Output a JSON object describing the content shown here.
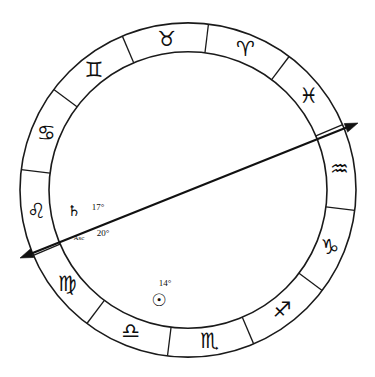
{
  "chart": {
    "type": "zodiac-wheel",
    "background_color": "#ffffff",
    "line_color": "#1a1a1a",
    "geometry": {
      "center_x": 188,
      "center_y": 190,
      "outer_radius": 168,
      "inner_radius": 139,
      "glyph_radius": 153,
      "sector_count": 12,
      "sector_span_degrees": 30,
      "aries_start_angle": -83
    },
    "signs": [
      {
        "name": "Aries",
        "glyph": "♈",
        "index": 0,
        "angle": -68,
        "glyph_size": 22
      },
      {
        "name": "Taurus",
        "glyph": "♉",
        "index": 1,
        "angle": -98,
        "glyph_size": 22
      },
      {
        "name": "Gemini",
        "glyph": "♊",
        "index": 2,
        "angle": -128,
        "glyph_size": 22
      },
      {
        "name": "Cancer",
        "glyph": "♋",
        "index": 3,
        "angle": -158,
        "glyph_size": 22
      },
      {
        "name": "Leo",
        "glyph": "♌",
        "index": 4,
        "angle": -188,
        "glyph_size": 22
      },
      {
        "name": "Virgo",
        "glyph": "♍",
        "index": 5,
        "angle": -218,
        "glyph_size": 21
      },
      {
        "name": "Libra",
        "glyph": "♎",
        "index": 6,
        "angle": -248,
        "glyph_size": 22
      },
      {
        "name": "Scorpio",
        "glyph": "♏",
        "index": 7,
        "angle": -278,
        "glyph_size": 21
      },
      {
        "name": "Sagittarius",
        "glyph": "♐",
        "index": 8,
        "angle": -308,
        "glyph_size": 19
      },
      {
        "name": "Capricorn",
        "glyph": "♑",
        "index": 9,
        "angle": -338,
        "glyph_size": 22
      },
      {
        "name": "Aquarius",
        "glyph": "♒",
        "index": 10,
        "angle": -368,
        "glyph_size": 21
      },
      {
        "name": "Pisces",
        "glyph": "♓",
        "index": 11,
        "angle": -398,
        "glyph_size": 21
      }
    ],
    "axis": {
      "name": "ascendant-descendant-axis",
      "start_x": 20,
      "start_y": 258,
      "end_x": 358,
      "end_y": 123,
      "double_headed": true
    },
    "placements": [
      {
        "name": "saturn",
        "glyph": "♄",
        "glyph_size": 15,
        "degree_label": "17°",
        "glyph_x": 74,
        "glyph_y": 211,
        "degree_x": 98,
        "degree_y": 207,
        "degree_size": 9
      },
      {
        "name": "ascendant",
        "glyph": "Asc",
        "glyph_size": 7,
        "degree_label": "20°",
        "glyph_x": 79,
        "glyph_y": 238,
        "degree_x": 103,
        "degree_y": 233,
        "degree_size": 9
      },
      {
        "name": "sun",
        "glyph": "☉",
        "glyph_size": 17,
        "degree_label": "14°",
        "glyph_x": 159,
        "glyph_y": 300,
        "degree_x": 165,
        "degree_y": 283,
        "degree_size": 9
      }
    ]
  }
}
